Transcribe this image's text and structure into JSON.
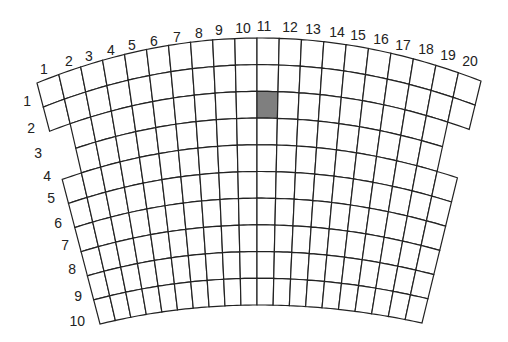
{
  "diagram": {
    "title": "",
    "grid": {
      "columns": 20,
      "rows": 10,
      "line_color": "#222222",
      "cell_fill": "#ffffff",
      "shaded_fill": "#7f7f7f",
      "top_arc": {
        "left": [
          37,
          83
        ],
        "mid": [
          257,
          38
        ],
        "right": [
          481,
          81
        ]
      },
      "bottom_arc": {
        "left": [
          100,
          324
        ],
        "mid": [
          257,
          305
        ],
        "right": [
          422,
          323
        ]
      },
      "missing_cells": [
        {
          "row": 3,
          "col": 1
        },
        {
          "row": 3,
          "col": 20
        },
        {
          "row": 4,
          "col": 1
        },
        {
          "row": 4,
          "col": 20
        }
      ],
      "shaded_cells": [
        {
          "row": 3,
          "col": 11
        }
      ]
    },
    "column_labels": [
      {
        "text": "1",
        "x": 44,
        "y": 74
      },
      {
        "text": "2",
        "x": 69,
        "y": 66
      },
      {
        "text": "3",
        "x": 89,
        "y": 61
      },
      {
        "text": "4",
        "x": 111,
        "y": 55
      },
      {
        "text": "5",
        "x": 132,
        "y": 50
      },
      {
        "text": "6",
        "x": 154,
        "y": 46
      },
      {
        "text": "7",
        "x": 177,
        "y": 42
      },
      {
        "text": "8",
        "x": 199,
        "y": 38
      },
      {
        "text": "9",
        "x": 219,
        "y": 35
      },
      {
        "text": "10",
        "x": 243,
        "y": 33
      },
      {
        "text": "11",
        "x": 264,
        "y": 31
      },
      {
        "text": "12",
        "x": 290,
        "y": 32
      },
      {
        "text": "13",
        "x": 313,
        "y": 34
      },
      {
        "text": "14",
        "x": 337,
        "y": 37
      },
      {
        "text": "15",
        "x": 358,
        "y": 40
      },
      {
        "text": "16",
        "x": 381,
        "y": 44
      },
      {
        "text": "17",
        "x": 403,
        "y": 50
      },
      {
        "text": "18",
        "x": 426,
        "y": 54
      },
      {
        "text": "19",
        "x": 448,
        "y": 60
      },
      {
        "text": "20",
        "x": 470,
        "y": 66
      }
    ],
    "row_labels": [
      {
        "text": "1",
        "x": 31,
        "y": 106
      },
      {
        "text": "2",
        "x": 35,
        "y": 133
      },
      {
        "text": "3",
        "x": 42,
        "y": 158
      },
      {
        "text": "4",
        "x": 51,
        "y": 181
      },
      {
        "text": "5",
        "x": 55,
        "y": 203
      },
      {
        "text": "6",
        "x": 62,
        "y": 228
      },
      {
        "text": "7",
        "x": 69,
        "y": 250
      },
      {
        "text": "8",
        "x": 76,
        "y": 274
      },
      {
        "text": "9",
        "x": 82,
        "y": 301
      },
      {
        "text": "10",
        "x": 85,
        "y": 326
      }
    ]
  }
}
